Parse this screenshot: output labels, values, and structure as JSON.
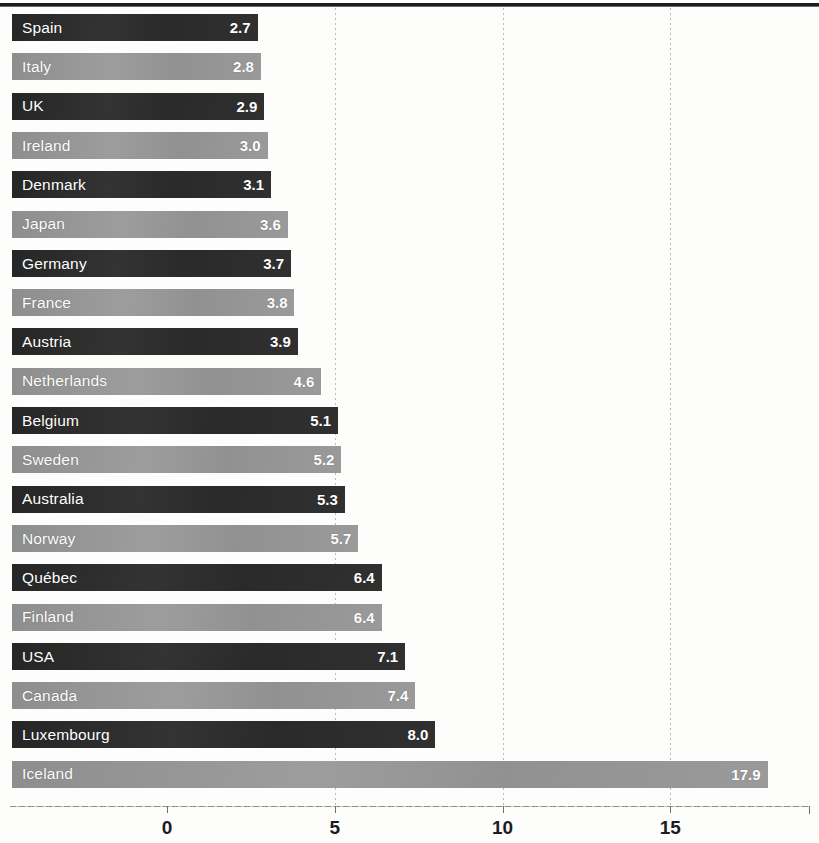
{
  "chart_data": {
    "type": "bar",
    "orientation": "horizontal",
    "title": "",
    "subtitle": "",
    "xlabel": "",
    "ylabel": "",
    "categories": [
      "Spain",
      "Italy",
      "UK",
      "Ireland",
      "Denmark",
      "Japan",
      "Germany",
      "France",
      "Austria",
      "Netherlands",
      "Belgium",
      "Sweden",
      "Australia",
      "Norway",
      "Québec",
      "Finland",
      "USA",
      "Canada",
      "Luxembourg",
      "Iceland"
    ],
    "values": [
      2.7,
      2.8,
      2.9,
      3.0,
      3.1,
      3.6,
      3.7,
      3.8,
      3.9,
      4.6,
      5.1,
      5.2,
      5.3,
      5.7,
      6.4,
      6.4,
      7.1,
      7.4,
      8.0,
      17.9
    ],
    "value_labels": [
      "2.7",
      "2.8",
      "2.9",
      "3.0",
      "3.1",
      "3.6",
      "3.7",
      "3.8",
      "3.9",
      "4.6",
      "5.1",
      "5.2",
      "5.3",
      "5.7",
      "6.4",
      "6.4",
      "7.1",
      "7.4",
      "8.0",
      "17.9"
    ],
    "xlim": [
      0,
      19.4
    ],
    "xticks": [
      0,
      5,
      10,
      15
    ],
    "xtick_labels": [
      "0",
      "5",
      "10",
      "15"
    ],
    "grid": "vertical-dotted-at-xticks",
    "legend": "none",
    "bar_colors": [
      "#2b2b2b",
      "#949494"
    ],
    "bar_color_pattern": "alternating dark/light by row",
    "value_label_color": "#ffffff",
    "category_label_color": "#ffffff",
    "category_label_position": "inside-bar-left",
    "value_label_position": "inside-bar-right"
  },
  "axis": {
    "ticks": [
      {
        "label": "0",
        "value": 0
      },
      {
        "label": "5",
        "value": 5
      },
      {
        "label": "10",
        "value": 10
      },
      {
        "label": "15",
        "value": 15
      }
    ]
  }
}
